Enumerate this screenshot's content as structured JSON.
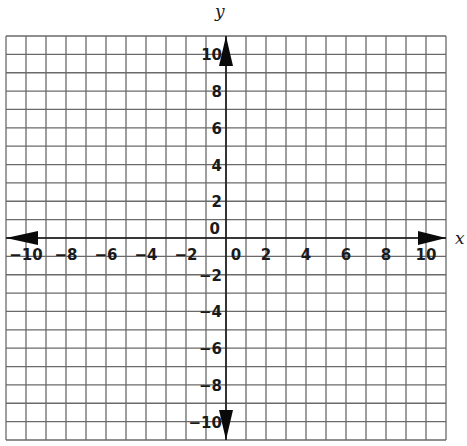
{
  "chart_data": {
    "type": "scatter",
    "title": "",
    "xlabel": "x",
    "ylabel": "y",
    "xlim": [
      -11,
      11
    ],
    "ylim": [
      -11,
      11
    ],
    "grid": true,
    "grid_step": 1,
    "x_ticks": [
      -10,
      -8,
      -6,
      -4,
      -2,
      0,
      2,
      4,
      6,
      8,
      10
    ],
    "y_ticks": [
      -10,
      -8,
      -6,
      -4,
      -2,
      0,
      2,
      4,
      6,
      8,
      10
    ],
    "x_tick_labels": [
      "−10",
      "−8",
      "−6",
      "−4",
      "−2",
      "0",
      "2",
      "4",
      "6",
      "8",
      "10"
    ],
    "y_tick_labels": [
      "−10",
      "−8",
      "−6",
      "−4",
      "−2",
      "0",
      "2",
      "4",
      "6",
      "8",
      "10"
    ],
    "axes_arrows": true,
    "series": [],
    "legend": null
  },
  "axis_labels": {
    "x": "x",
    "y": "y"
  },
  "colors": {
    "grid": "#6a6a6a",
    "axis": "#1a1a1a",
    "background": "#ffffff"
  }
}
